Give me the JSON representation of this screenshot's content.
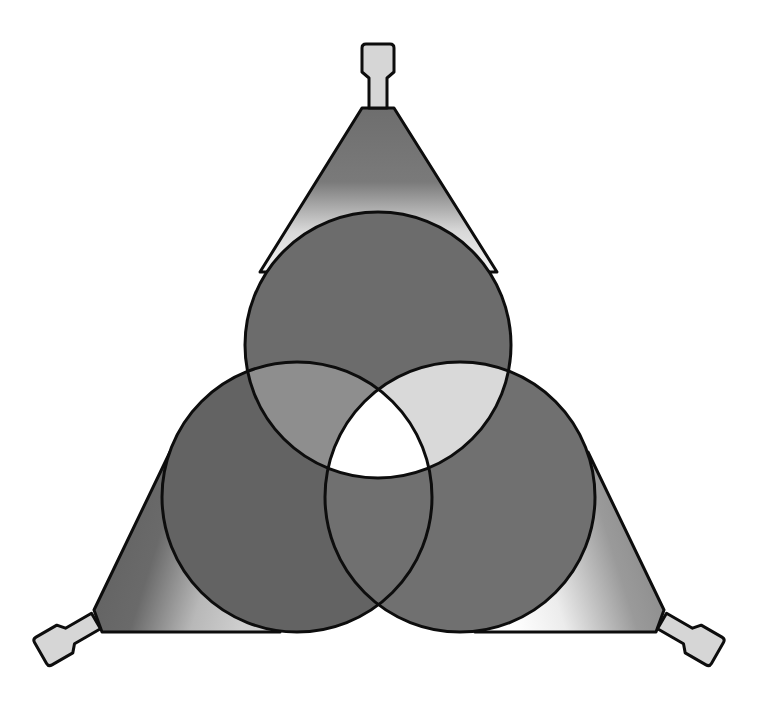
{
  "diagram": {
    "colors": {
      "background": "#ffffff",
      "outline": "#0d0d0d",
      "beam_fill": "#6a6a6a",
      "cone_dark": "#6e6e6e",
      "cone_light": "#f2f2f2",
      "nozzle_fill": "#d6d6d6",
      "overlap_top_left": "#8e8e8e",
      "overlap_top_right": "#d9d9d9",
      "overlap_bottom": "#6f6f6f",
      "overlap_center": "#ffffff"
    },
    "beams": [
      {
        "name": "top",
        "cx": 378,
        "cy": 345,
        "r": 133
      },
      {
        "name": "bottom-left",
        "cx": 297,
        "cy": 497,
        "r": 135
      },
      {
        "name": "bottom-right",
        "cx": 460,
        "cy": 497,
        "r": 135
      }
    ],
    "projectors": [
      {
        "name": "top",
        "x": 378,
        "y": 80,
        "angle": 0
      },
      {
        "name": "bottom-left",
        "x": 72,
        "y": 636,
        "angle": 240
      },
      {
        "name": "bottom-right",
        "x": 688,
        "y": 636,
        "angle": 120
      }
    ]
  }
}
